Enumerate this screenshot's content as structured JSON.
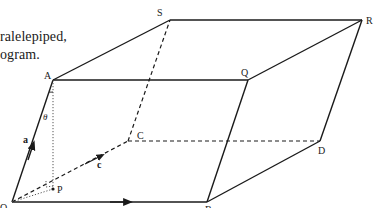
{
  "caption": {
    "line1": "ralelepiped,",
    "line2": "ogram."
  },
  "figure": {
    "vertices": {
      "O": {
        "label": "O",
        "x": 12,
        "y": 202
      },
      "B": {
        "label": "B",
        "x": 207,
        "y": 202
      },
      "A": {
        "label": "A",
        "x": 53,
        "y": 80
      },
      "Q": {
        "label": "Q",
        "x": 248,
        "y": 80
      },
      "C": {
        "label": "C",
        "x": 128,
        "y": 141
      },
      "D": {
        "label": "D",
        "x": 320,
        "y": 141
      },
      "S": {
        "label": "S",
        "x": 170,
        "y": 20
      },
      "R": {
        "label": "R",
        "x": 362,
        "y": 20
      },
      "P": {
        "label": "P",
        "x": 53,
        "y": 189
      }
    },
    "vector_labels": {
      "a": "a",
      "c": "c"
    },
    "angle_label": "θ",
    "line_color": "#1a1a1a"
  }
}
